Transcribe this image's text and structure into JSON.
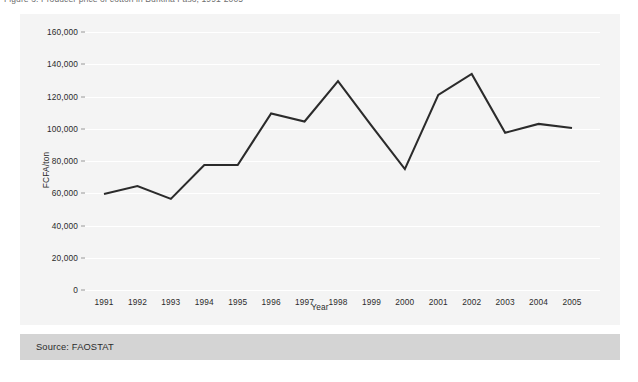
{
  "caption": {
    "text": "Figure 3. Producer price of cotton in Burkina Faso, 1991-2005"
  },
  "source": {
    "label": "Source: FAOSTAT"
  },
  "chart_data": {
    "type": "line",
    "title": "",
    "xlabel": "Year",
    "ylabel": "FCFA/ton",
    "categories": [
      "1991",
      "1992",
      "1993",
      "1994",
      "1995",
      "1996",
      "1997",
      "1998",
      "1999",
      "2000",
      "2001",
      "2002",
      "2003",
      "2004",
      "2005"
    ],
    "values": [
      59500,
      64500,
      56500,
      77500,
      77500,
      109500,
      104500,
      129500,
      102000,
      75000,
      121000,
      134000,
      97500,
      103000,
      100500
    ],
    "series": [
      {
        "name": "Producer price",
        "values": [
          59500,
          64500,
          56500,
          77500,
          77500,
          109500,
          104500,
          129500,
          102000,
          75000,
          121000,
          134000,
          97500,
          103000,
          100500
        ]
      }
    ],
    "ylim": [
      0,
      160000
    ],
    "yticks": [
      0,
      20000,
      40000,
      60000,
      80000,
      100000,
      120000,
      140000,
      160000
    ],
    "ytick_labels": [
      "0",
      "20,000",
      "40,000",
      "60,000",
      "80,000",
      "100,000",
      "120,000",
      "140,000",
      "160,000"
    ],
    "grid": true,
    "legend": "none",
    "line_color": "#2b2b2b",
    "plot_background": "#f4f4f4",
    "grid_color": "#ffffff"
  }
}
